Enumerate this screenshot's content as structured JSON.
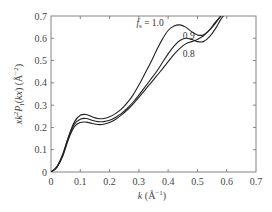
{
  "chart_data": {
    "type": "line",
    "title": "",
    "xlabel": "k (Å⁻¹)",
    "ylabel": "xk²P_I(kx) (Å⁻²)",
    "xlim": [
      0,
      0.7
    ],
    "ylim": [
      0,
      0.7
    ],
    "xticks": [
      0,
      0.1,
      0.2,
      0.3,
      0.4,
      0.5,
      0.6,
      0.7
    ],
    "yticks": [
      0,
      0.1,
      0.2,
      0.3,
      0.4,
      0.5,
      0.6,
      0.7
    ],
    "xtick_labels": [
      "0",
      "0.1",
      "0.2",
      "0.3",
      "0.4",
      "0.5",
      "0.6",
      "0.7"
    ],
    "ytick_labels": [
      "0",
      "0.1",
      "0.2",
      "0.3",
      "0.4",
      "0.5",
      "0.6",
      "0.7"
    ],
    "grid": false,
    "legend": "inline curve labels",
    "series": [
      {
        "name": "f_s = 1.0",
        "label": "f_s = 1.0",
        "x": [
          0,
          0.02,
          0.04,
          0.06,
          0.08,
          0.1,
          0.12,
          0.14,
          0.16,
          0.18,
          0.2,
          0.22,
          0.24,
          0.26,
          0.28,
          0.3,
          0.32,
          0.34,
          0.36,
          0.38,
          0.4,
          0.42,
          0.44,
          0.46,
          0.48,
          0.5,
          0.52,
          0.54,
          0.56,
          0.58,
          0.6
        ],
        "y": [
          0,
          0.025,
          0.08,
          0.16,
          0.225,
          0.255,
          0.258,
          0.248,
          0.24,
          0.24,
          0.248,
          0.262,
          0.282,
          0.31,
          0.345,
          0.39,
          0.44,
          0.49,
          0.545,
          0.595,
          0.635,
          0.655,
          0.66,
          0.65,
          0.63,
          0.615,
          0.615,
          0.635,
          0.67,
          0.7,
          0.73
        ]
      },
      {
        "name": "f_s = 0.9",
        "label": "0.9",
        "x": [
          0,
          0.02,
          0.04,
          0.06,
          0.08,
          0.1,
          0.12,
          0.14,
          0.16,
          0.18,
          0.2,
          0.22,
          0.24,
          0.26,
          0.28,
          0.3,
          0.32,
          0.34,
          0.36,
          0.38,
          0.4,
          0.42,
          0.44,
          0.46,
          0.48,
          0.5,
          0.52,
          0.54,
          0.56,
          0.58,
          0.6
        ],
        "y": [
          0,
          0.022,
          0.075,
          0.155,
          0.215,
          0.237,
          0.24,
          0.232,
          0.226,
          0.226,
          0.232,
          0.245,
          0.262,
          0.285,
          0.313,
          0.345,
          0.38,
          0.415,
          0.45,
          0.49,
          0.53,
          0.565,
          0.59,
          0.6,
          0.595,
          0.585,
          0.585,
          0.605,
          0.64,
          0.685,
          0.72
        ]
      },
      {
        "name": "f_s = 0.8",
        "label": "0.8",
        "x": [
          0,
          0.02,
          0.04,
          0.06,
          0.08,
          0.1,
          0.12,
          0.14,
          0.16,
          0.18,
          0.2,
          0.22,
          0.24,
          0.26,
          0.28,
          0.3,
          0.32,
          0.34,
          0.36,
          0.38,
          0.4,
          0.42,
          0.44,
          0.46,
          0.48,
          0.5,
          0.52,
          0.54,
          0.56,
          0.58,
          0.6
        ],
        "y": [
          0,
          0.02,
          0.07,
          0.148,
          0.203,
          0.222,
          0.224,
          0.218,
          0.213,
          0.214,
          0.222,
          0.236,
          0.255,
          0.278,
          0.305,
          0.335,
          0.366,
          0.398,
          0.43,
          0.462,
          0.495,
          0.528,
          0.555,
          0.575,
          0.585,
          0.595,
          0.61,
          0.635,
          0.665,
          0.7,
          0.735
        ]
      }
    ]
  }
}
